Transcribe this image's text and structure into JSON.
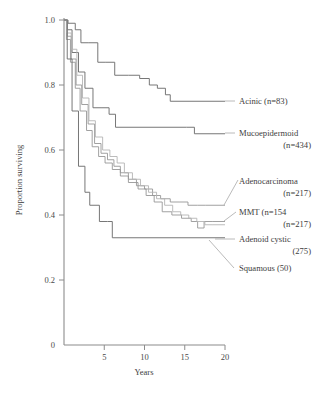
{
  "chart_data": {
    "type": "line",
    "title": "",
    "subtitle": "",
    "xlabel": "Years",
    "ylabel": "Proportion surviving",
    "xlim": [
      0,
      20
    ],
    "ylim": [
      0,
      1.0
    ],
    "grid": false,
    "legend_position": "right-inline-annotations",
    "x_ticks": [
      "5",
      "10",
      "15",
      "20"
    ],
    "x_tick_values": [
      5,
      10,
      15,
      20
    ],
    "y_ticks": [
      "0",
      "0.2",
      "0.4",
      "0.6",
      "0.8",
      "1.0"
    ],
    "y_tick_values": [
      0,
      0.2,
      0.4,
      0.6,
      0.8,
      1.0
    ],
    "step_style": "post",
    "series": [
      {
        "name": "Acinic",
        "n": 83,
        "label": "Acinic (n=83)",
        "tone": "dark",
        "x": [
          0,
          0.5,
          1.4,
          2.1,
          3.0,
          4.2,
          5.2,
          6.3,
          8.0,
          9.4,
          10.6,
          11.6,
          12.6,
          13.2,
          20
        ],
        "y": [
          1.0,
          0.99,
          0.97,
          0.93,
          0.93,
          0.87,
          0.87,
          0.83,
          0.83,
          0.82,
          0.8,
          0.79,
          0.77,
          0.75,
          0.75
        ]
      },
      {
        "name": "Mucoepidermoid",
        "n": 434,
        "label": "Mucoepidermoid (n=434)",
        "tone": "dark",
        "x": [
          0,
          0.4,
          1.0,
          1.8,
          2.6,
          3.6,
          4.6,
          5.6,
          6.4,
          15.2,
          16.2,
          20
        ],
        "y": [
          1.0,
          0.97,
          0.9,
          0.84,
          0.79,
          0.73,
          0.73,
          0.71,
          0.67,
          0.67,
          0.65,
          0.65
        ]
      },
      {
        "name": "Adenocarcinoma",
        "n": 217,
        "label": "Adenocarcinoma (n=217)",
        "tone": "mid",
        "x": [
          0,
          0.4,
          0.9,
          1.5,
          2.2,
          3.0,
          3.8,
          4.6,
          5.4,
          6.2,
          7.0,
          8.0,
          9.0,
          10.0,
          11.0,
          12.0,
          13.2,
          14.4,
          15.4,
          16.6,
          17.6,
          20
        ],
        "y": [
          1.0,
          0.95,
          0.88,
          0.8,
          0.74,
          0.68,
          0.62,
          0.59,
          0.57,
          0.55,
          0.53,
          0.51,
          0.49,
          0.48,
          0.46,
          0.45,
          0.44,
          0.44,
          0.43,
          0.43,
          0.43,
          0.43
        ]
      },
      {
        "name": "MMT",
        "n": 154,
        "label": "MMT (n=154",
        "tone": "mid",
        "x": [
          0,
          0.3,
          0.8,
          1.4,
          2.0,
          2.8,
          3.5,
          4.3,
          5.1,
          6.0,
          7.0,
          8.0,
          9.2,
          10.2,
          11.2,
          12.2,
          13.4,
          14.6,
          15.8,
          16.6,
          17.4,
          18.4,
          20
        ],
        "y": [
          1.0,
          0.94,
          0.87,
          0.79,
          0.72,
          0.66,
          0.61,
          0.58,
          0.56,
          0.54,
          0.52,
          0.5,
          0.48,
          0.46,
          0.44,
          0.41,
          0.4,
          0.39,
          0.38,
          0.36,
          0.38,
          0.38,
          0.38
        ]
      },
      {
        "name": "Adenoid cystic",
        "n": 217,
        "label": "(n=217)",
        "tone": "light",
        "x": [
          0,
          0.35,
          0.9,
          1.6,
          2.3,
          3.1,
          3.9,
          4.8,
          5.7,
          6.6,
          7.5,
          8.5,
          9.5,
          10.5,
          11.5,
          12.5,
          13.5,
          14.5,
          15.5,
          16.5,
          17.5,
          18.5,
          20
        ],
        "y": [
          1.0,
          0.96,
          0.91,
          0.83,
          0.76,
          0.69,
          0.64,
          0.6,
          0.58,
          0.56,
          0.53,
          0.51,
          0.49,
          0.47,
          0.45,
          0.43,
          0.41,
          0.4,
          0.39,
          0.38,
          0.37,
          0.37,
          0.37
        ]
      },
      {
        "name": "Squamous",
        "n": 50,
        "label": "Squamous (50)",
        "tone": "dark",
        "x": [
          0,
          0.4,
          1.0,
          1.8,
          2.6,
          3.2,
          4.4,
          5.4,
          6.0,
          20
        ],
        "y": [
          1.0,
          0.88,
          0.72,
          0.55,
          0.47,
          0.43,
          0.38,
          0.38,
          0.33,
          0.33
        ]
      }
    ],
    "annotations": [
      {
        "id": "acinic",
        "lines": [
          "Acinic (n=83)"
        ]
      },
      {
        "id": "mucoepidermoid",
        "lines": [
          "Mucoepidermoid",
          "(n=434)"
        ]
      },
      {
        "id": "adenocarcinoma",
        "lines": [
          "Adenocarcinoma",
          "(n=217)"
        ]
      },
      {
        "id": "mmt",
        "lines": [
          "MMT (n=154",
          "(n=217)"
        ]
      },
      {
        "id": "adenoid-cystic",
        "lines": [
          "Adenoid cystic",
          "(275)"
        ]
      },
      {
        "id": "squamous",
        "lines": [
          "Squamous (50)"
        ]
      }
    ]
  },
  "colors": {
    "axis": "#8c8c8c",
    "curve_dark": "#707070",
    "curve_mid": "#969696",
    "curve_light": "#b4b4b4",
    "text": "#3d3d3d",
    "background": "#ffffff"
  }
}
